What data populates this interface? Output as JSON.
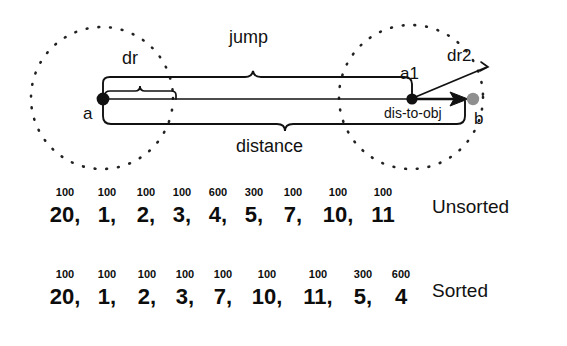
{
  "diagram": {
    "labels": {
      "jump": "jump",
      "dr": "dr",
      "a": "a",
      "a1": "a1",
      "dr2": "dr2",
      "dis_to_obj": "dis-to-obj",
      "b": "b",
      "distance": "distance"
    },
    "colors": {
      "stroke": "#111111",
      "node_a": "#111111",
      "node_a1": "#111111",
      "node_b": "#8f8f8f",
      "circle_dotted": "#222222",
      "background": "#ffffff"
    },
    "geometry": {
      "circle_a": {
        "cx": 102,
        "cy": 98,
        "r": 71
      },
      "circle_b": {
        "cx": 411,
        "cy": 97,
        "r": 72
      },
      "point_a": {
        "x": 103,
        "y": 99
      },
      "point_a1": {
        "x": 412,
        "y": 99
      },
      "point_b": {
        "x": 473,
        "y": 99
      },
      "dr2_tip": {
        "x": 487,
        "y": 67
      }
    }
  },
  "chart_data": {
    "type": "table",
    "title": "",
    "columns": [
      "weight",
      "value"
    ],
    "rows": [
      {
        "tag": "Unsorted",
        "weights": [
          "100",
          "100",
          "100",
          "100",
          "600",
          "300",
          "100",
          "100",
          "100"
        ],
        "values": [
          "20,",
          "1,",
          "2,",
          "3,",
          "4,",
          "5,",
          "7,",
          "10,",
          "11"
        ]
      },
      {
        "tag": "Sorted",
        "weights": [
          "100",
          "100",
          "100",
          "100",
          "100",
          "100",
          "100",
          "300",
          "600"
        ],
        "values": [
          "20,",
          "1,",
          "2,",
          "3,",
          "7,",
          "10,",
          "11,",
          "5,",
          "4"
        ]
      }
    ]
  },
  "rows_meta": {
    "unsorted": {
      "tag": "Unsorted",
      "weights": [
        "100",
        "100",
        "100",
        "100",
        "600",
        "300",
        "100",
        "100",
        "100"
      ],
      "values": [
        "20,",
        "1,",
        "2,",
        "3,",
        "4,",
        "5,",
        "7,",
        "10,",
        "11"
      ]
    },
    "sorted": {
      "tag": "Sorted",
      "weights": [
        "100",
        "100",
        "100",
        "100",
        "100",
        "100",
        "100",
        "300",
        "600"
      ],
      "values": [
        "20,",
        "1,",
        "2,",
        "3,",
        "7,",
        "10,",
        "11,",
        "5,",
        "4"
      ]
    }
  }
}
